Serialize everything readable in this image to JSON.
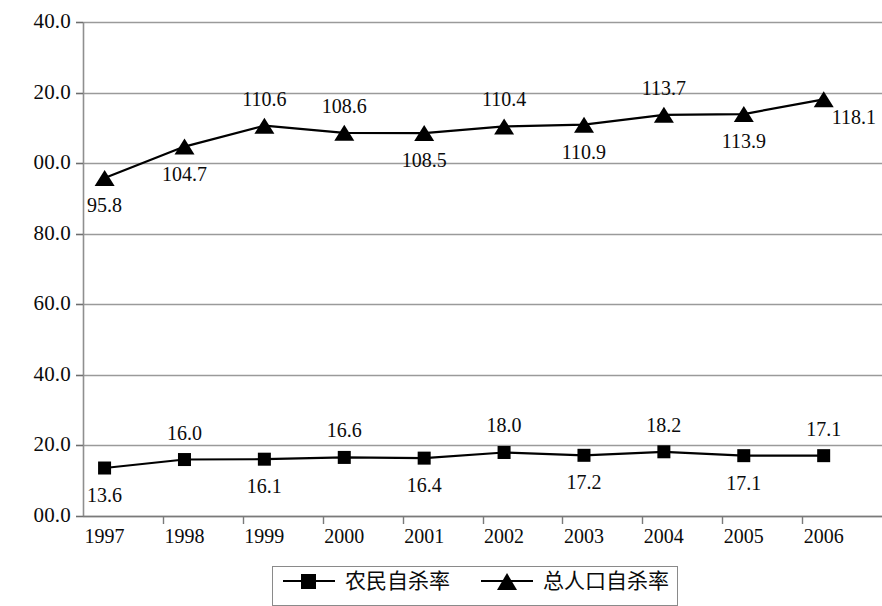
{
  "chart_data": {
    "type": "line",
    "title": "",
    "subtitle": "",
    "xlabel": "",
    "ylabel": "",
    "categories": [
      "1997",
      "1998",
      "1999",
      "2000",
      "2001",
      "2002",
      "2003",
      "2004",
      "2005",
      "2006"
    ],
    "series": [
      {
        "name": "农民自杀率",
        "marker": "square",
        "color": "#000000",
        "values": [
          13.6,
          16.0,
          16.1,
          16.6,
          16.4,
          18.0,
          17.2,
          18.2,
          17.1,
          17.1
        ],
        "labels": [
          "13.6",
          "16.0",
          "16.1",
          "16.6",
          "16.4",
          "18.0",
          "17.2",
          "18.2",
          "17.1",
          "17.1"
        ],
        "label_positions": [
          "below",
          "above",
          "below",
          "above",
          "below",
          "above",
          "below",
          "above",
          "below",
          "above"
        ]
      },
      {
        "name": "总人口自杀率",
        "marker": "triangle",
        "color": "#000000",
        "values": [
          95.8,
          104.7,
          110.6,
          108.6,
          108.5,
          110.4,
          110.9,
          113.7,
          113.9,
          118.1
        ],
        "labels": [
          "95.8",
          "104.7",
          "110.6",
          "108.6",
          "108.5",
          "110.4",
          "110.9",
          "113.7",
          "113.9",
          "118.1"
        ],
        "label_positions": [
          "below",
          "below",
          "above",
          "above",
          "below",
          "above",
          "below",
          "above",
          "below",
          "right"
        ]
      }
    ],
    "ylim": [
      0,
      140
    ],
    "ytick_values": [
      140,
      120,
      100,
      80,
      60,
      40,
      20,
      0
    ],
    "ytick_labels": [
      "40.0",
      "20.0",
      "00.0",
      "80.0",
      "60.0",
      "40.0",
      "20.0",
      "00.0"
    ],
    "grid": true,
    "grid_color": "#9a9a9a",
    "legend_position": "bottom",
    "legend": [
      {
        "label": "农民自杀率",
        "marker": "square"
      },
      {
        "label": "总人口自杀率",
        "marker": "triangle"
      }
    ]
  }
}
